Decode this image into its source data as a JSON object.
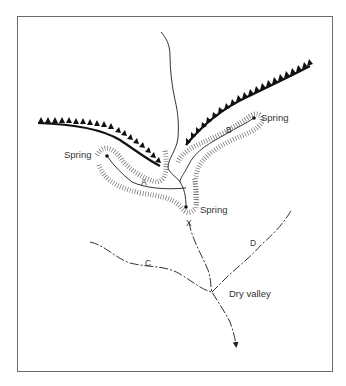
{
  "diagram": {
    "type": "river network / spring-line map",
    "labels": {
      "spring_left": "Spring",
      "spring_right": "Spring",
      "spring_center": "Spring",
      "stream_a": "A",
      "stream_b": "B",
      "stream_c": "C",
      "stream_d": "D",
      "point_x": "X",
      "dry_valley": "Dry valley"
    },
    "symbols": {
      "escarpment": "scarp-edge triangles",
      "valley_slopes": "hachures",
      "dry_valley": "dashed line",
      "flow_direction": "arrow"
    },
    "colors": {
      "ink": "#222222",
      "frame": "#6a6a6a",
      "background": "#ffffff"
    }
  }
}
